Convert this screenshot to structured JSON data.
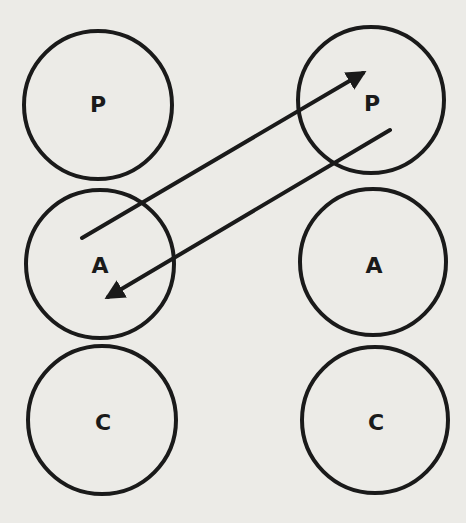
{
  "diagram": {
    "type": "transactional-analysis-ego-states",
    "colors": {
      "background": "#ecebe7",
      "stroke": "#1a1a1a"
    },
    "left_person": {
      "states": [
        {
          "label": "P",
          "cx": 98,
          "cy": 105,
          "r": 74
        },
        {
          "label": "A",
          "cx": 100,
          "cy": 264,
          "r": 74
        },
        {
          "label": "C",
          "cx": 102,
          "cy": 420,
          "r": 74
        }
      ]
    },
    "right_person": {
      "states": [
        {
          "label": "P",
          "cx": 371,
          "cy": 100,
          "r": 73
        },
        {
          "label": "A",
          "cx": 373,
          "cy": 262,
          "r": 73
        },
        {
          "label": "C",
          "cx": 375,
          "cy": 420,
          "r": 73
        }
      ]
    },
    "arrows": [
      {
        "from": "left A",
        "to": "right P",
        "x1": 82,
        "y1": 238,
        "x2": 363,
        "y2": 73
      },
      {
        "from": "right P",
        "to": "left A",
        "x1": 390,
        "y1": 130,
        "x2": 108,
        "y2": 297
      }
    ]
  }
}
